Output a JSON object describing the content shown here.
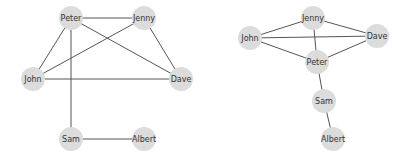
{
  "style": {
    "node_fill": "#dcdcdc",
    "edge_color": "#555555",
    "label_color": "#333333",
    "node_radius": 12
  },
  "graphs": [
    {
      "name": "graph-left",
      "nodes": [
        {
          "id": "Peter",
          "label": "Peter",
          "x": 71,
          "y": 18
        },
        {
          "id": "Jenny",
          "label": "Jenny",
          "x": 144,
          "y": 18
        },
        {
          "id": "John",
          "label": "John",
          "x": 33,
          "y": 79
        },
        {
          "id": "Dave",
          "label": "Dave",
          "x": 181,
          "y": 79
        },
        {
          "id": "Sam",
          "label": "Sam",
          "x": 71,
          "y": 139
        },
        {
          "id": "Albert",
          "label": "Albert",
          "x": 144,
          "y": 139
        }
      ],
      "edges": [
        [
          "Peter",
          "Jenny"
        ],
        [
          "Peter",
          "John"
        ],
        [
          "Peter",
          "Dave"
        ],
        [
          "Peter",
          "Sam"
        ],
        [
          "Jenny",
          "John"
        ],
        [
          "Jenny",
          "Dave"
        ],
        [
          "John",
          "Dave"
        ],
        [
          "Sam",
          "Albert"
        ]
      ]
    },
    {
      "name": "graph-right",
      "nodes": [
        {
          "id": "Jenny",
          "label": "Jenny",
          "x": 313,
          "y": 18
        },
        {
          "id": "John",
          "label": "John",
          "x": 250,
          "y": 38
        },
        {
          "id": "Dave",
          "label": "Dave",
          "x": 377,
          "y": 36
        },
        {
          "id": "Peter",
          "label": "Peter",
          "x": 317,
          "y": 62
        },
        {
          "id": "Sam",
          "label": "Sam",
          "x": 324,
          "y": 101
        },
        {
          "id": "Albert",
          "label": "Albert",
          "x": 333,
          "y": 139
        }
      ],
      "edges": [
        [
          "Jenny",
          "John"
        ],
        [
          "Jenny",
          "Dave"
        ],
        [
          "Jenny",
          "Peter"
        ],
        [
          "John",
          "Dave"
        ],
        [
          "John",
          "Peter"
        ],
        [
          "Dave",
          "Peter"
        ],
        [
          "Peter",
          "Sam"
        ],
        [
          "Sam",
          "Albert"
        ]
      ]
    }
  ]
}
